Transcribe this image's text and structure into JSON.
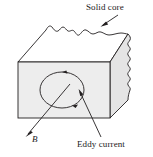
{
  "figure": {
    "title_semantic": "solid-core-eddy-current-diagram",
    "labels": {
      "solid_core": "Solid core",
      "eddy_current": "Eddy current",
      "magnetic_field": "B"
    },
    "colors": {
      "stroke": "#231f20",
      "front_face_fill": "#ededed",
      "right_face_fill": "#e4e4e4",
      "top_face_fill": "#ffffff",
      "text": "#1a1a1a",
      "background": "#ffffff"
    },
    "geometry": {
      "front_face": "18,62 110,62 110,118 18,118",
      "top_face_back_edge": "torn/jagged",
      "right_face": "110,62 128,34 128,100 110,118",
      "right_edge": "torn/jagged"
    },
    "annotations": {
      "eddy_loop_direction": "clockwise",
      "eddy_loop_center_x": 62,
      "eddy_loop_center_y": 90,
      "eddy_loop_radius_x": 22,
      "eddy_loop_radius_y": 18,
      "solid_core_leader": "arrow pointing down-left to torn top edge",
      "eddy_current_leader": "line from label up-left to loop interior",
      "b_field_arrow": "arrow pointing down-left out of front face"
    }
  }
}
